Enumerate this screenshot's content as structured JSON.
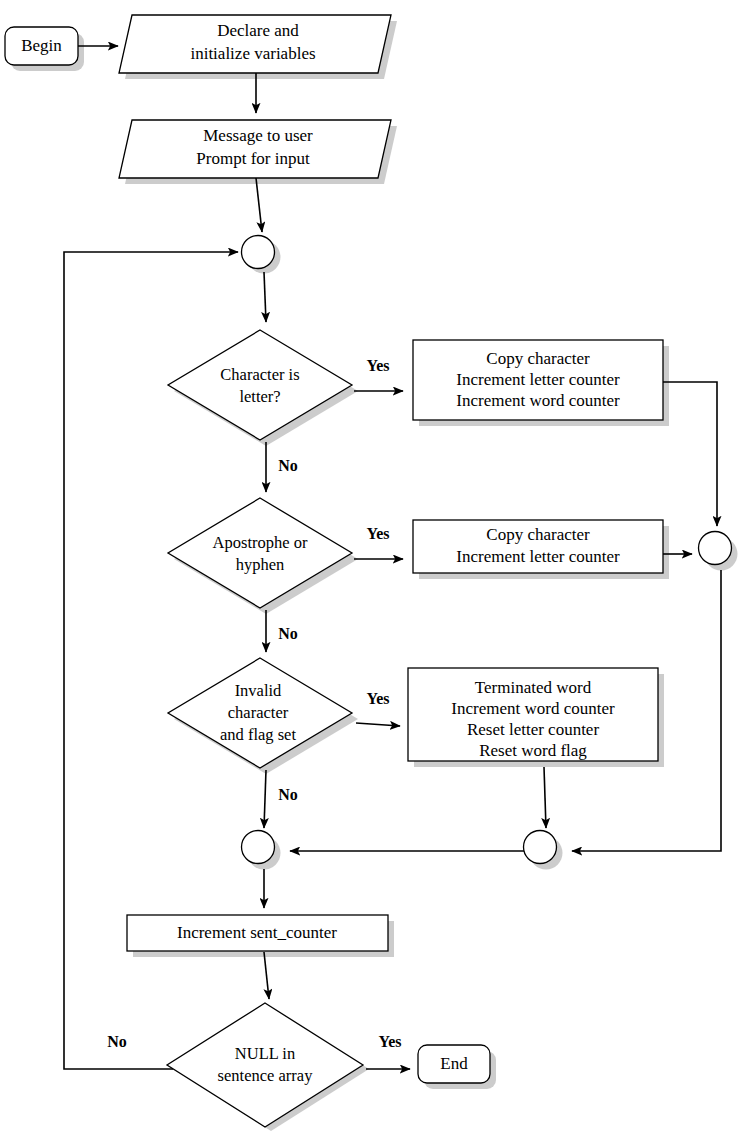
{
  "diagram": {
    "colors": {
      "stroke": "#000000",
      "fill": "#ffffff",
      "shadow": "#b8b8b8",
      "background": "#ffffff"
    },
    "nodes": {
      "begin": {
        "label": "Begin",
        "shape": "terminator"
      },
      "declare": {
        "line1": "Declare and",
        "line2": "initialize variables",
        "shape": "io-parallelogram"
      },
      "message": {
        "line1": "Message to user",
        "line2": "Prompt for input",
        "shape": "io-parallelogram"
      },
      "loop_connector": {
        "label": "",
        "shape": "connector-circle"
      },
      "decision_letter": {
        "line1": "Character is",
        "line2": "letter?",
        "shape": "decision-diamond"
      },
      "process_letter": {
        "line1": "Copy character",
        "line2": "Increment letter counter",
        "line3": "Increment word counter",
        "shape": "process-box"
      },
      "decision_apostrophe": {
        "line1": "Apostrophe or",
        "line2": "hyphen",
        "shape": "decision-diamond"
      },
      "process_apostrophe": {
        "line1": "Copy character",
        "line2": "Increment letter counter",
        "shape": "process-box"
      },
      "right_connector": {
        "label": "",
        "shape": "connector-circle"
      },
      "decision_invalid": {
        "line1": "Invalid",
        "line2": "character",
        "line3": "and flag set",
        "shape": "decision-diamond"
      },
      "process_invalid": {
        "line1": "Terminated word",
        "line2": "Increment word counter",
        "line3": "Reset letter counter",
        "line4": "Reset word flag",
        "shape": "process-box"
      },
      "merge_left": {
        "label": "",
        "shape": "connector-circle"
      },
      "merge_right": {
        "label": "",
        "shape": "connector-circle"
      },
      "increment_sent": {
        "label": "Increment sent_counter",
        "shape": "process-box"
      },
      "decision_null": {
        "line1": "NULL in",
        "line2": "sentence array",
        "shape": "decision-diamond"
      },
      "end": {
        "label": "End",
        "shape": "terminator"
      }
    },
    "branch_labels": {
      "letter_yes": "Yes",
      "letter_no": "No",
      "apostrophe_yes": "Yes",
      "apostrophe_no": "No",
      "invalid_yes": "Yes",
      "invalid_no": "No",
      "null_yes": "Yes",
      "null_no": "No"
    }
  }
}
